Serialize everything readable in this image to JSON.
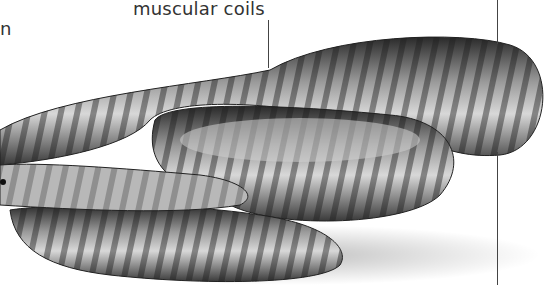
{
  "illustration": {
    "subject": "snake-coiled",
    "style": "grayscale banded python illustration"
  },
  "labels": {
    "muscular_coils": "muscular coils",
    "left_fragment": "n"
  },
  "colors": {
    "text": "#333333",
    "leader_line": "#444444",
    "background": "#ffffff"
  }
}
